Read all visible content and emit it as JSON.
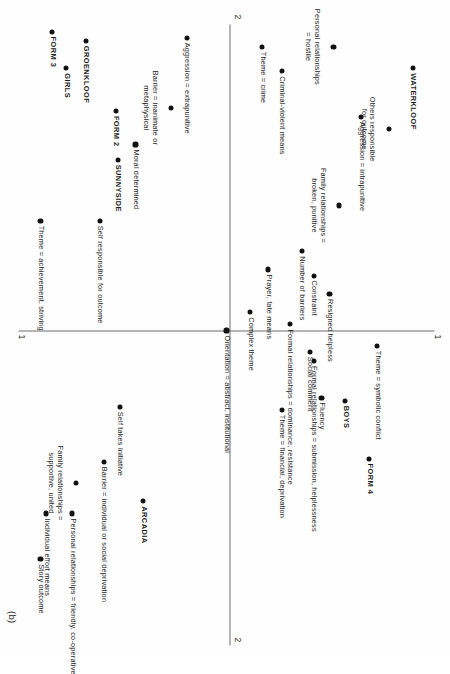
{
  "figure": {
    "panel_tag": "(b)",
    "orientation": "page rotated 90 degrees (landscape plot on portrait page)"
  },
  "axes": {
    "vertical_axis_label_top": "1",
    "vertical_axis_label_bottom": "1",
    "horizontal_axis_label_left": "2",
    "horizontal_axis_label_right": "2"
  },
  "chart_data": {
    "type": "scatter",
    "title": "",
    "subtitle": "",
    "xlabel": "1",
    "ylabel": "2",
    "xlim": [
      -1.0,
      1.0
    ],
    "ylim": [
      -1.0,
      1.0
    ],
    "grid": false,
    "legend": null,
    "marker": "filled-circle",
    "points": [
      {
        "label": "WATERKLOOF",
        "x": -0.86,
        "y": 0.92,
        "anchor": "left",
        "bold": true
      },
      {
        "label": "Aggression = intrapunitive",
        "x": -0.7,
        "y": 0.66,
        "anchor": "left"
      },
      {
        "label": "Others responsible\nfor outcome",
        "x": -0.66,
        "y": 0.8,
        "anchor": "left"
      },
      {
        "label": "Personal relationships\n= hostile",
        "x": -0.93,
        "y": 0.52,
        "anchor": "left"
      },
      {
        "label": "Criminal-violent means",
        "x": -0.85,
        "y": 0.26,
        "anchor": "left"
      },
      {
        "label": "Theme = crime",
        "x": -0.93,
        "y": 0.16,
        "anchor": "left"
      },
      {
        "label": "Family relationships =\nbroken, punitive",
        "x": -0.41,
        "y": 0.55,
        "anchor": "left"
      },
      {
        "label": "Aggression = extrapunitive",
        "x": -0.96,
        "y": -0.22,
        "anchor": "left"
      },
      {
        "label": "Barrier = inanimate or\nmetaphysical",
        "x": -0.73,
        "y": -0.3,
        "anchor": "left"
      },
      {
        "label": "Formal relationships = dominance, resistance",
        "x": -0.02,
        "y": 0.3,
        "anchor": "left"
      },
      {
        "label": "Resigned helpless",
        "x": -0.12,
        "y": 0.5,
        "anchor": "left"
      },
      {
        "label": "Theme = symbolic conflict",
        "x": 0.05,
        "y": 0.74,
        "anchor": "left"
      },
      {
        "label": "BOYS",
        "x": 0.23,
        "y": 0.58,
        "anchor": "left",
        "bold": true
      },
      {
        "label": "FORM 4",
        "x": 0.42,
        "y": 0.7,
        "anchor": "left",
        "bold": true
      },
      {
        "label": "Number of barriers",
        "x": -0.26,
        "y": 0.36,
        "anchor": "left"
      },
      {
        "label": "Social comment",
        "x": 0.07,
        "y": 0.4,
        "anchor": "left"
      },
      {
        "label": "Constraint",
        "x": -0.18,
        "y": 0.42,
        "anchor": "left"
      },
      {
        "label": "Formal relationships = submission, helplessness",
        "x": 0.1,
        "y": 0.42,
        "anchor": "left"
      },
      {
        "label": "Fluency",
        "x": 0.22,
        "y": 0.46,
        "anchor": "left"
      },
      {
        "label": "Prayer, fate means",
        "x": -0.2,
        "y": 0.19,
        "anchor": "left"
      },
      {
        "label": "Complex theme",
        "x": -0.06,
        "y": 0.1,
        "anchor": "left"
      },
      {
        "label": "Theme = financial, deprivation",
        "x": 0.26,
        "y": 0.26,
        "anchor": "left"
      },
      {
        "label": "Orientation = abstract, institutional",
        "x": 0.0,
        "y": -0.02,
        "anchor": "left"
      },
      {
        "label": "Moral determined",
        "x": -0.61,
        "y": -0.48,
        "anchor": "left"
      },
      {
        "label": "SUNNYSIDE",
        "x": -0.56,
        "y": -0.57,
        "anchor": "left",
        "bold": true
      },
      {
        "label": "FORM 2",
        "x": -0.72,
        "y": -0.58,
        "anchor": "left",
        "bold": true
      },
      {
        "label": "GROENKLOOF",
        "x": -0.95,
        "y": -0.73,
        "anchor": "left",
        "bold": true
      },
      {
        "label": "GIRLS",
        "x": -0.86,
        "y": -0.83,
        "anchor": "left",
        "bold": true
      },
      {
        "label": "FORM 3",
        "x": -0.98,
        "y": -0.9,
        "anchor": "left",
        "bold": true
      },
      {
        "label": "Self responsible for outcome",
        "x": -0.36,
        "y": -0.66,
        "anchor": "left"
      },
      {
        "label": "Theme = achievement, striving",
        "x": -0.36,
        "y": -0.96,
        "anchor": "left"
      },
      {
        "label": "Self takes initiative",
        "x": 0.25,
        "y": -0.56,
        "anchor": "left"
      },
      {
        "label": "ARCADIA",
        "x": 0.56,
        "y": -0.44,
        "anchor": "left",
        "bold": true
      },
      {
        "label": "Barrier = individual or social deprivation",
        "x": 0.43,
        "y": -0.64,
        "anchor": "left"
      },
      {
        "label": "Family relationships =\nsupportive, united",
        "x": 0.5,
        "y": -0.78,
        "anchor": "left"
      },
      {
        "label": "Personal relationships = friendly, co-operative",
        "x": 0.6,
        "y": -0.8,
        "anchor": "left"
      },
      {
        "label": "Individual effort means",
        "x": 0.6,
        "y": -0.93,
        "anchor": "left"
      },
      {
        "label": "Story outcome",
        "x": 0.75,
        "y": -0.96,
        "anchor": "left"
      }
    ]
  }
}
